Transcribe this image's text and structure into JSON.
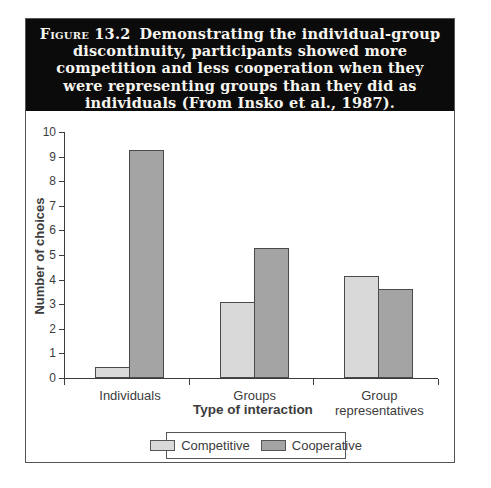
{
  "figure": {
    "label": "Figure 13.2",
    "caption_lines": [
      "Demonstrating the individual-group",
      "discontinuity, participants showed more",
      "competition and less cooperation when they",
      "were representing groups than they did as",
      "individuals (From Insko et al., 1987)."
    ]
  },
  "chart_data": {
    "type": "bar",
    "categories": [
      "Individuals",
      "Groups",
      "Group representatives"
    ],
    "series": [
      {
        "name": "Competitive",
        "values": [
          0.45,
          3.1,
          4.15
        ],
        "color": "#d9d9d9"
      },
      {
        "name": "Cooperative",
        "values": [
          9.25,
          5.3,
          3.6
        ],
        "color": "#a4a4a4"
      }
    ],
    "xlabel": "Type of interaction",
    "ylabel": "Number of choices",
    "ylim": [
      0,
      10
    ],
    "yticks": [
      0,
      1,
      2,
      3,
      4,
      5,
      6,
      7,
      8,
      9,
      10
    ],
    "grid": false,
    "legend_position": "bottom",
    "bar_border_color": "#4a4a4a"
  },
  "colors": {
    "header_bg": "#0b0b0b",
    "header_text": "#f7f5ef",
    "axis": "#3c3c3c",
    "figure_border": "#555555"
  }
}
